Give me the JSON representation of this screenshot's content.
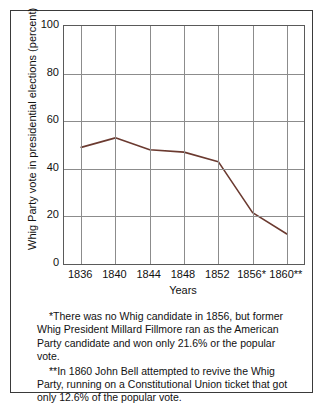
{
  "chart_data": {
    "type": "line",
    "title": "",
    "xlabel": "Years",
    "ylabel": "Whig Party vote in presidential elections (percent)",
    "categories": [
      "1836",
      "1840",
      "1844",
      "1848",
      "1852",
      "1856*",
      "1860**"
    ],
    "values": [
      49,
      53,
      48,
      47,
      43,
      21.6,
      12.6
    ],
    "series": [
      {
        "name": "Whig Party vote",
        "values": [
          49,
          53,
          48,
          47,
          43,
          21.6,
          12.6
        ]
      }
    ],
    "ylim": [
      0,
      100
    ],
    "yticks": [
      "0",
      "20",
      "40",
      "60",
      "80",
      "100"
    ],
    "ytick_values": [
      0,
      20,
      40,
      60,
      80,
      100
    ],
    "grid": true,
    "legend": "none",
    "line_color": "#6b3a30"
  },
  "footnotes": [
    "*There was no Whig candidate in 1856, but former Whig President Millard Fillmore ran as the American Party candidate and won only 21.6% or the popular vote.",
    "**In 1860 John Bell attempted to revive the Whig Party, running on a Constitutional Union ticket that got only 12.6% of the popular vote."
  ]
}
